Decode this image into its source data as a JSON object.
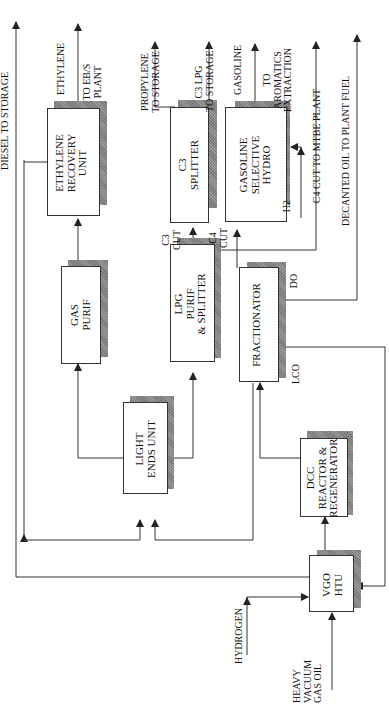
{
  "diagram": {
    "type": "process-flow",
    "orientation": "rotated-90-ccw",
    "units": {
      "vgo_htu": {
        "line1": "VGO",
        "line2": "HTU"
      },
      "dcc_reactor": {
        "line1": "DCC",
        "line2": "REACTOR &",
        "line3": "REGENERATOR"
      },
      "fractionator": {
        "line1": "FRACTIONATOR"
      },
      "light_ends": {
        "line1": "LIGHT",
        "line2": "ENDS UNIT"
      },
      "gas_purif": {
        "line1": "GAS",
        "line2": "PURIF"
      },
      "lpg_purif": {
        "line1": "LPG",
        "line2": "PURIF",
        "line3": "&  SPLITTER"
      },
      "ethylene_recovery": {
        "line1": "ETHYLENE",
        "line2": "RECOVERY",
        "line3": "UNIT"
      },
      "c3_splitter": {
        "line1": "C3",
        "line2": "SPLITTER"
      },
      "gasoline_hydro": {
        "line1": "GASOLINE",
        "line2": "SELECTIVE",
        "line3": "HYDRO"
      }
    },
    "streams": {
      "hvgo": "HEAVY\nVACUUM\nGAS OIL",
      "hydrogen": "HYDROGEN",
      "diesel": "DIESEL TO STORAGE",
      "ethylene": "ETHYLENE",
      "to_ebs": "TO EB/S\nPLANT",
      "propylene": "PROPYLENE\nTO STORAGE",
      "c3_lpg": "C3 LPG\nTO STORAGE",
      "gasoline": "GASOLINE",
      "to_aromatics": "TO\nAROMATICS\nEXTRACTION",
      "c3_cut": "C3\nCUT",
      "c4_cut": "C4\nCUT",
      "h2": "H2",
      "c4_mtbe": "C4 CUT TO MTBE PLANT",
      "decanted_oil": "DECANTED OIL TO PLANT FUEL",
      "do": "DO",
      "lco": "LCO"
    },
    "colors": {
      "line": "#333333",
      "shadow": "#888888",
      "background": "#ffffff"
    }
  }
}
